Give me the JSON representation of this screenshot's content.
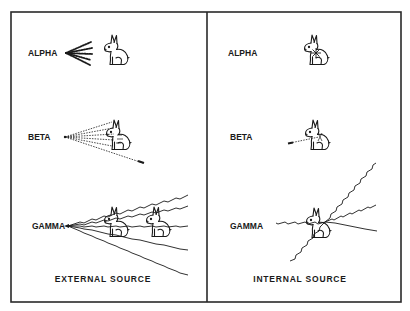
{
  "figure": {
    "colors": {
      "ink": "#1a1a1a",
      "background": "#ffffff",
      "frame": "#2a2a2a"
    },
    "panels": [
      {
        "id": "external",
        "caption": "EXTERNAL SOURCE",
        "rows": [
          {
            "label": "ALPHA",
            "radiation": "alpha-dots",
            "rabbits": 1,
            "note": "short dotted rays stop before rabbit"
          },
          {
            "label": "BETA",
            "radiation": "beta-dotted-fan",
            "rabbits": 1,
            "note": "dotted fan penetrates rabbit partially"
          },
          {
            "label": "GAMMA",
            "radiation": "gamma-wavy-fan",
            "rabbits": 2,
            "note": "wavy rays pass through both rabbits"
          }
        ]
      },
      {
        "id": "internal",
        "caption": "INTERNAL SOURCE",
        "rows": [
          {
            "label": "ALPHA",
            "radiation": "alpha-internal-burst",
            "rabbits": 1,
            "note": "burst contained inside rabbit"
          },
          {
            "label": "BETA",
            "radiation": "beta-internal-short",
            "rabbits": 1,
            "note": "short dotted ray exiting rabbit"
          },
          {
            "label": "GAMMA",
            "radiation": "gamma-internal-wavy",
            "rabbits": 1,
            "note": "wavy rays radiating out of rabbit"
          }
        ]
      }
    ]
  }
}
